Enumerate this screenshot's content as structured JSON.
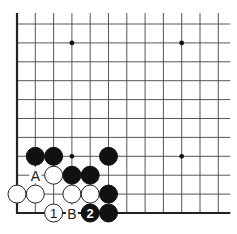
{
  "diagram": {
    "type": "go-board",
    "colors": {
      "background": "#ffffff",
      "grid": "#444444",
      "edge": "#222222",
      "black_stone": "#111111",
      "white_stone": "#ffffff"
    },
    "grid": {
      "columns": 12,
      "rows": 11,
      "origin_x": 17,
      "origin_y": 24,
      "spacing_x": 18.3,
      "spacing_y": 18.9,
      "edges": [
        "left",
        "bottom"
      ]
    },
    "hoshi": [
      {
        "col": 3,
        "row": 1
      },
      {
        "col": 9,
        "row": 1
      },
      {
        "col": 3,
        "row": 7
      },
      {
        "col": 9,
        "row": 7
      }
    ],
    "stones": [
      {
        "color": "black",
        "col": 1,
        "row": 7,
        "label": ""
      },
      {
        "color": "black",
        "col": 2,
        "row": 7,
        "label": ""
      },
      {
        "color": "black",
        "col": 5,
        "row": 7,
        "label": ""
      },
      {
        "color": "white",
        "col": 2,
        "row": 8,
        "label": ""
      },
      {
        "color": "black",
        "col": 3,
        "row": 8,
        "label": ""
      },
      {
        "color": "black",
        "col": 4,
        "row": 8,
        "label": ""
      },
      {
        "color": "white",
        "col": 0,
        "row": 9,
        "label": ""
      },
      {
        "color": "white",
        "col": 1,
        "row": 9,
        "label": ""
      },
      {
        "color": "white",
        "col": 3,
        "row": 9,
        "label": ""
      },
      {
        "color": "white",
        "col": 4,
        "row": 9,
        "label": ""
      },
      {
        "color": "black",
        "col": 5,
        "row": 9,
        "label": ""
      },
      {
        "color": "white",
        "col": 2,
        "row": 10,
        "label": "1"
      },
      {
        "color": "black",
        "col": 4,
        "row": 10,
        "label": "2"
      },
      {
        "color": "black",
        "col": 5,
        "row": 10,
        "label": ""
      }
    ],
    "point_labels": [
      {
        "text": "A",
        "col": 1,
        "row": 8
      },
      {
        "text": "B",
        "col": 3,
        "row": 10
      }
    ]
  }
}
